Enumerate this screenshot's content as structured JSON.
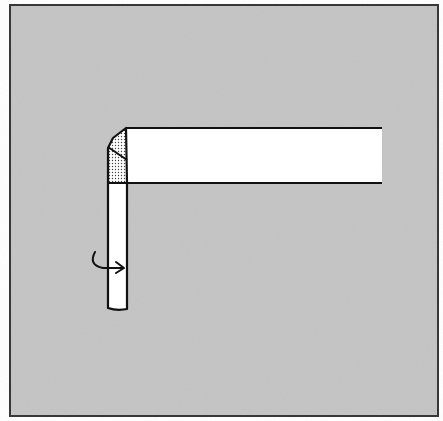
{
  "diagram": {
    "type": "folding-instruction",
    "colors": {
      "background": "#c4c4c4",
      "paper": "#ffffff",
      "outline": "#111111",
      "shading": "#444444",
      "frame": "#333333"
    },
    "elements": [
      {
        "name": "horizontal-strip",
        "label": ""
      },
      {
        "name": "vertical-strip",
        "label": ""
      },
      {
        "name": "folded-corner",
        "label": ""
      },
      {
        "name": "rotate-arrow",
        "label": ""
      }
    ]
  }
}
